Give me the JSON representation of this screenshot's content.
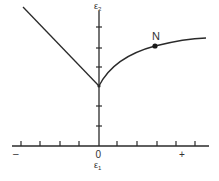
{
  "diagram": {
    "type": "line-diagram",
    "axes": {
      "x_label": "ε",
      "x_label_sub": "1",
      "y_label": "ε",
      "y_label_sub": "2",
      "origin_label": "0",
      "negative_label": "–",
      "positive_label": "+",
      "x_ticks_left": 4,
      "x_ticks_right": 5,
      "y_ticks_below_vertex": 2,
      "y_ticks_above_vertex": 3
    },
    "curves": [
      {
        "name": "left-linear-branch",
        "shape": "straight line from upper-left down to vertex on ε2 axis"
      },
      {
        "name": "right-concave-branch",
        "shape": "concave curve rising from vertex and leveling off to the right"
      }
    ],
    "points": [
      {
        "label": "N",
        "description": "marked point on right branch"
      }
    ],
    "colors": {
      "line": "#2a2a2a",
      "background": "#ffffff"
    }
  }
}
